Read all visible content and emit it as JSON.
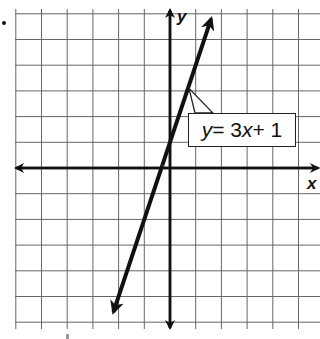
{
  "chart_data": {
    "type": "line",
    "title": "",
    "xlabel": "x",
    "ylabel": "y",
    "grid": true,
    "xlim": [
      -6,
      5.7
    ],
    "ylim": [
      -6,
      6
    ],
    "grid_spacing": 1,
    "series": [
      {
        "name": "y = 3x + 1",
        "equation": "y = 3x + 1",
        "slope": 3,
        "intercept": 1,
        "x": [
          -2.2,
          1.6
        ],
        "y": [
          -5.6,
          5.8
        ]
      }
    ],
    "annotations": [
      {
        "text": "y = 3x + 1",
        "points_to": [
          0.7,
          3.1
        ]
      }
    ],
    "legend": "none"
  },
  "labels": {
    "x_axis": "x",
    "y_axis": "y",
    "equation_var": "y",
    "equation_eq": " = 3",
    "equation_x": "x",
    "equation_rest": " + 1"
  },
  "style": {
    "grid_color": "#555555",
    "axis_color": "#111111",
    "line_color": "#111111",
    "background": "#ffffff"
  }
}
